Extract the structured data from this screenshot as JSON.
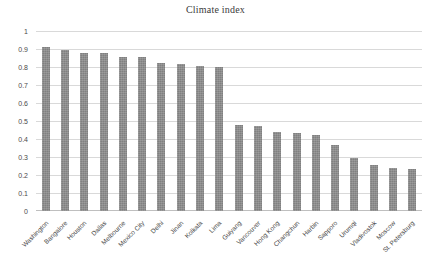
{
  "chart_data": {
    "type": "bar",
    "title": "Climate index",
    "xlabel": "",
    "ylabel": "",
    "ylim": [
      0,
      1
    ],
    "ytick_step": 0.1,
    "grid": true,
    "legend": false,
    "bar_color": "#808080",
    "categories": [
      "Washington",
      "Bangalore",
      "Houston",
      "Dallas",
      "Melbourne",
      "Mexico City",
      "Delhi",
      "Jinan",
      "Kolkata",
      "Lima",
      "Guiyang",
      "Vancouver",
      "Hong Kong",
      "Changchun",
      "Harbin",
      "Sapporo",
      "Urumqi",
      "Vladivostok",
      "Moscow",
      "St. Petersburg"
    ],
    "values": [
      0.91,
      0.895,
      0.88,
      0.878,
      0.857,
      0.853,
      0.824,
      0.818,
      0.803,
      0.802,
      0.478,
      0.474,
      0.441,
      0.431,
      0.424,
      0.368,
      0.296,
      0.253,
      0.238,
      0.233
    ],
    "ytick_labels": [
      "1",
      "0.9",
      "0.8",
      "0.7",
      "0.6",
      "0.5",
      "0.4",
      "0.3",
      "0.2",
      "0.1",
      "0"
    ],
    "ytick_values": [
      1,
      0.9,
      0.8,
      0.7,
      0.6,
      0.5,
      0.4,
      0.3,
      0.2,
      0.1,
      0
    ]
  }
}
